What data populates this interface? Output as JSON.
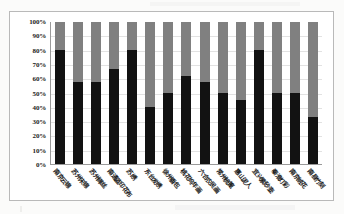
{
  "chart_data": {
    "type": "bar",
    "subtype": "100% stacked column",
    "title": "",
    "xlabel": "",
    "ylabel": "",
    "ylim": [
      0,
      100
    ],
    "ytick_labels": [
      "100%",
      "90%",
      "80%",
      "70%",
      "60%",
      "50%",
      "40%",
      "30%",
      "20%",
      "10%",
      "0%"
    ],
    "ytick_values": [
      100,
      90,
      80,
      70,
      60,
      50,
      40,
      30,
      20,
      10,
      0
    ],
    "grid": true,
    "legend": "none",
    "categories": [
      "南京云锦",
      "苏州宋锦",
      "苏州缂丝",
      "南通蓝印花布",
      "苏绣",
      "东台发绣",
      "徐州香包",
      "桃花坞年画",
      "六合农民画",
      "常州梳篦",
      "惠山泥人",
      "宜兴紫砂壶",
      "秦淮灯彩",
      "南京绒花",
      "南县竹刻"
    ],
    "series": [
      {
        "name": "series-1-black",
        "color": "#121212",
        "values": [
          80,
          57.5,
          57.5,
          67,
          80,
          40,
          50,
          62,
          57.5,
          50,
          45,
          80,
          50,
          50,
          33
        ]
      },
      {
        "name": "series-2-gray",
        "color": "#808080",
        "values": [
          20,
          42.5,
          42.5,
          33,
          20,
          60,
          50,
          38,
          42.5,
          50,
          55,
          20,
          50,
          50,
          67
        ]
      }
    ]
  },
  "colors": {
    "series_1": "#121212",
    "series_2": "#808080",
    "grid": "#e2e2e2",
    "axis": "#9a9a9a",
    "frame": "#b9b9b9",
    "page_background": "#fbfbfa"
  }
}
